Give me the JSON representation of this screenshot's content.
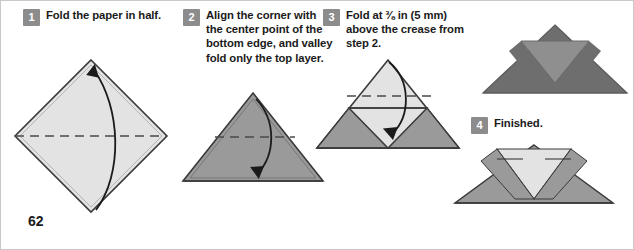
{
  "page": {
    "number": "62"
  },
  "palette": {
    "paper_light": "#e3e3e3",
    "paper_mid": "#9a9a9a",
    "paper_dark": "#6e6e6e",
    "paper_midlight": "#c9c9c9",
    "outline": "#3a3a3a",
    "badge_bg": "#8c8c8c",
    "badge_text": "#ffffff",
    "text": "#1b1b1b",
    "crease_dash": "#4a4a4a",
    "arrow": "#1b1b1b",
    "border": "#c9c9c9"
  },
  "steps": [
    {
      "number": "1",
      "text": "Fold the paper in half.",
      "figure": "square-diamond-with-horizontal-valley-crease-and-upward-arrow"
    },
    {
      "number": "2",
      "text": "Align the corner with the center point of the bottom edge, and valley fold only the top layer.",
      "figure": "triangle-with-horizontal-crease-and-downward-arrow"
    },
    {
      "number": "3",
      "text": "Fold at ⅜ in (5 mm) above the crease from step 2.",
      "figure": "triangle-with-notch-dashed-crease-and-downward-arrow"
    },
    {
      "number": "4",
      "text": "Finished.",
      "figure": "finished-wide-form-with-v-notch"
    }
  ],
  "figures": {
    "fig1": {
      "name": "diamond-square-step1",
      "fill": "#e3e3e3"
    },
    "fig2": {
      "name": "triangle-step2",
      "fill": "#9a9a9a"
    },
    "fig3": {
      "name": "triangle-notched-step3",
      "fill_top": "#e3e3e3",
      "fill_base": "#9a9a9a"
    },
    "fig4": {
      "name": "dark-preview-form",
      "fill": "#6e6e6e",
      "fill_notch": "#8f8f8f"
    },
    "fig5": {
      "name": "finished-form",
      "fill": "#9a9a9a",
      "fill_notch": "#e3e3e3"
    }
  }
}
